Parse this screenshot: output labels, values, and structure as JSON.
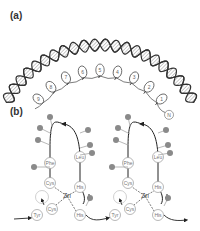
{
  "panels": [
    {
      "label": "(a)",
      "description": "DNA double helix with zinc finger protein wrapped in major groove",
      "fingers": [
        "9",
        "8",
        "7",
        "6",
        "5",
        "4",
        "3",
        "2",
        "1"
      ],
      "terminus": "N"
    },
    {
      "label": "(b)",
      "description": "Two zinc finger motifs",
      "center_ion": "Zn",
      "residues": {
        "phe": "Phe",
        "leu": "Leu",
        "cys": "Cys",
        "his": "His",
        "tyr": "Tyr"
      }
    }
  ],
  "colors": {
    "strand": "#333333",
    "circle_stroke": "#999999",
    "dot": "#8a8a8a"
  }
}
